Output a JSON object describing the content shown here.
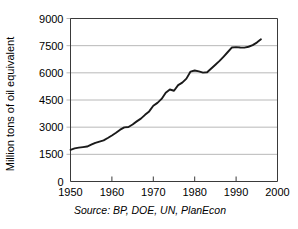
{
  "chart_data": {
    "type": "line",
    "title": "",
    "xlabel": "",
    "ylabel": "Million tons of oil equivalent",
    "source_note": "Source: BP, DOE, UN, PlanEcon",
    "xlim": [
      1950,
      2000
    ],
    "ylim": [
      0,
      9000
    ],
    "grid": true,
    "legend": "none",
    "x_ticks": [
      1950,
      1960,
      1970,
      1980,
      1990,
      2000
    ],
    "x_tick_labels": [
      "1950",
      "1960",
      "1970",
      "1980",
      "1990",
      "2000"
    ],
    "y_ticks": [
      0,
      1500,
      3000,
      4500,
      6000,
      7500,
      9000
    ],
    "y_tick_labels": [
      "0",
      "1500",
      "3000",
      "4500",
      "6000",
      "7500",
      "9000"
    ],
    "series": [
      {
        "name": "World energy consumption",
        "x": [
          1950,
          1951,
          1952,
          1953,
          1954,
          1955,
          1956,
          1957,
          1958,
          1959,
          1960,
          1961,
          1962,
          1963,
          1964,
          1965,
          1966,
          1967,
          1968,
          1969,
          1970,
          1971,
          1972,
          1973,
          1974,
          1975,
          1976,
          1977,
          1978,
          1979,
          1980,
          1981,
          1982,
          1983,
          1984,
          1985,
          1986,
          1987,
          1988,
          1989,
          1990,
          1991,
          1992,
          1993,
          1994,
          1995,
          1996
        ],
        "values": [
          1750,
          1830,
          1870,
          1900,
          1930,
          2030,
          2130,
          2200,
          2270,
          2400,
          2540,
          2690,
          2860,
          2990,
          3010,
          3150,
          3320,
          3470,
          3680,
          3870,
          4180,
          4340,
          4560,
          4900,
          5080,
          5010,
          5320,
          5460,
          5680,
          6070,
          6130,
          6080,
          6010,
          6030,
          6240,
          6450,
          6660,
          6900,
          7150,
          7400,
          7420,
          7400,
          7390,
          7440,
          7530,
          7670,
          7850
        ]
      }
    ]
  },
  "axis": {
    "y_label_text": "Million tons of oil equivalent"
  }
}
